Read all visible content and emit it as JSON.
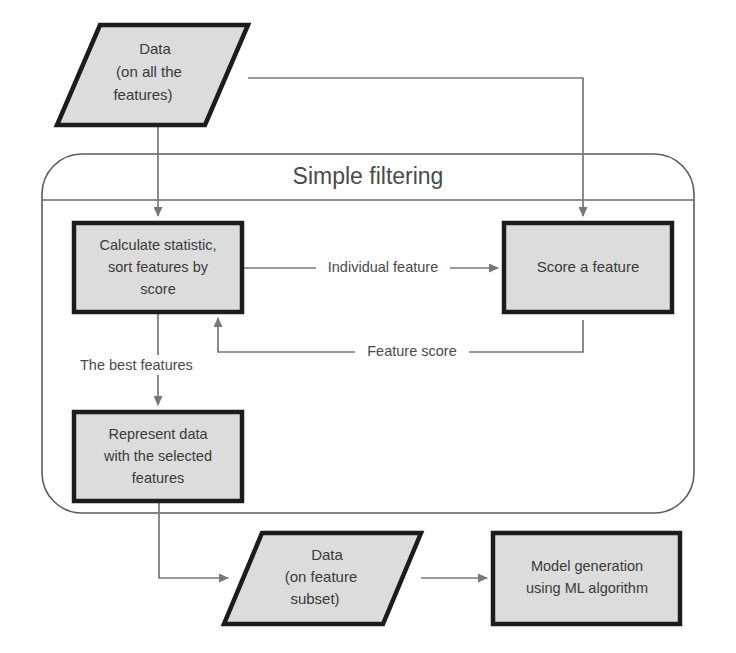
{
  "diagram": {
    "title": "Simple filtering",
    "background_color": "#ffffff",
    "node_fill_color": "#dcdcdc",
    "node_border_color": "#1c1c1c",
    "connector_color": "#787878",
    "group": {
      "label": "Simple filtering",
      "shape": "rounded-rectangle"
    },
    "nodes": [
      {
        "id": "data-all-features",
        "shape": "parallelogram",
        "lines": [
          "Data",
          "(on all the",
          "features)"
        ]
      },
      {
        "id": "calculate-statistic",
        "shape": "rectangle",
        "lines": [
          "Calculate statistic,",
          "sort features by",
          "score"
        ]
      },
      {
        "id": "score-a-feature",
        "shape": "rectangle",
        "lines": [
          "Score a feature"
        ]
      },
      {
        "id": "represent-data",
        "shape": "rectangle",
        "lines": [
          "Represent data",
          "with the selected",
          "features"
        ]
      },
      {
        "id": "data-feature-subset",
        "shape": "parallelogram",
        "lines": [
          "Data",
          "(on feature",
          "subset)"
        ]
      },
      {
        "id": "model-generation",
        "shape": "rectangle",
        "lines": [
          "Model generation",
          "using ML algorithm"
        ]
      }
    ],
    "edges": [
      {
        "id": "data-to-calculate",
        "from": "data-all-features",
        "to": "calculate-statistic",
        "label": ""
      },
      {
        "id": "data-to-score",
        "from": "data-all-features",
        "to": "score-a-feature",
        "label": ""
      },
      {
        "id": "calculate-to-score",
        "from": "calculate-statistic",
        "to": "score-a-feature",
        "label": "Individual feature"
      },
      {
        "id": "score-to-calculate",
        "from": "score-a-feature",
        "to": "calculate-statistic",
        "label": "Feature score"
      },
      {
        "id": "calculate-to-represent",
        "from": "calculate-statistic",
        "to": "represent-data",
        "label": "The best  features"
      },
      {
        "id": "represent-to-subset",
        "from": "represent-data",
        "to": "data-feature-subset",
        "label": ""
      },
      {
        "id": "subset-to-model",
        "from": "data-feature-subset",
        "to": "model-generation",
        "label": ""
      }
    ]
  }
}
